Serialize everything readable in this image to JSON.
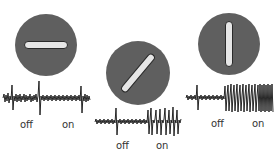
{
  "figure": {
    "colors": {
      "disc": "#5f5f5f",
      "bar": "#e6e6e6",
      "trace": "#111111"
    },
    "panels": [
      {
        "orientation": "horizontal",
        "angle_deg": 0,
        "labels": {
          "off": "off",
          "on": "on"
        },
        "response": "low"
      },
      {
        "orientation": "diagonal",
        "angle_deg": -45,
        "labels": {
          "off": "off",
          "on": "on"
        },
        "response": "medium"
      },
      {
        "orientation": "vertical",
        "angle_deg": 90,
        "labels": {
          "off": "off",
          "on": "on"
        },
        "response": "high"
      }
    ]
  }
}
